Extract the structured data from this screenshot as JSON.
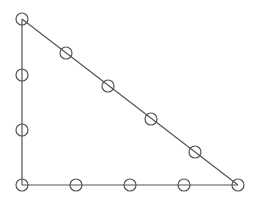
{
  "diagram": {
    "type": "right-triangle-with-node-circles",
    "stroke_color": "#555555",
    "circle_radius": 6,
    "vertices": [
      {
        "x": 22,
        "y": 19
      },
      {
        "x": 22,
        "y": 185
      },
      {
        "x": 238,
        "y": 185
      }
    ],
    "edges": [
      {
        "from": 0,
        "to": 1
      },
      {
        "from": 1,
        "to": 2
      },
      {
        "from": 2,
        "to": 0
      }
    ],
    "nodes": [
      {
        "x": 22,
        "y": 19
      },
      {
        "x": 22,
        "y": 75
      },
      {
        "x": 22,
        "y": 130
      },
      {
        "x": 22,
        "y": 185
      },
      {
        "x": 76,
        "y": 185
      },
      {
        "x": 130,
        "y": 185
      },
      {
        "x": 184,
        "y": 185
      },
      {
        "x": 238,
        "y": 185
      },
      {
        "x": 66,
        "y": 53
      },
      {
        "x": 108,
        "y": 86
      },
      {
        "x": 151,
        "y": 119
      },
      {
        "x": 195,
        "y": 152
      }
    ]
  }
}
